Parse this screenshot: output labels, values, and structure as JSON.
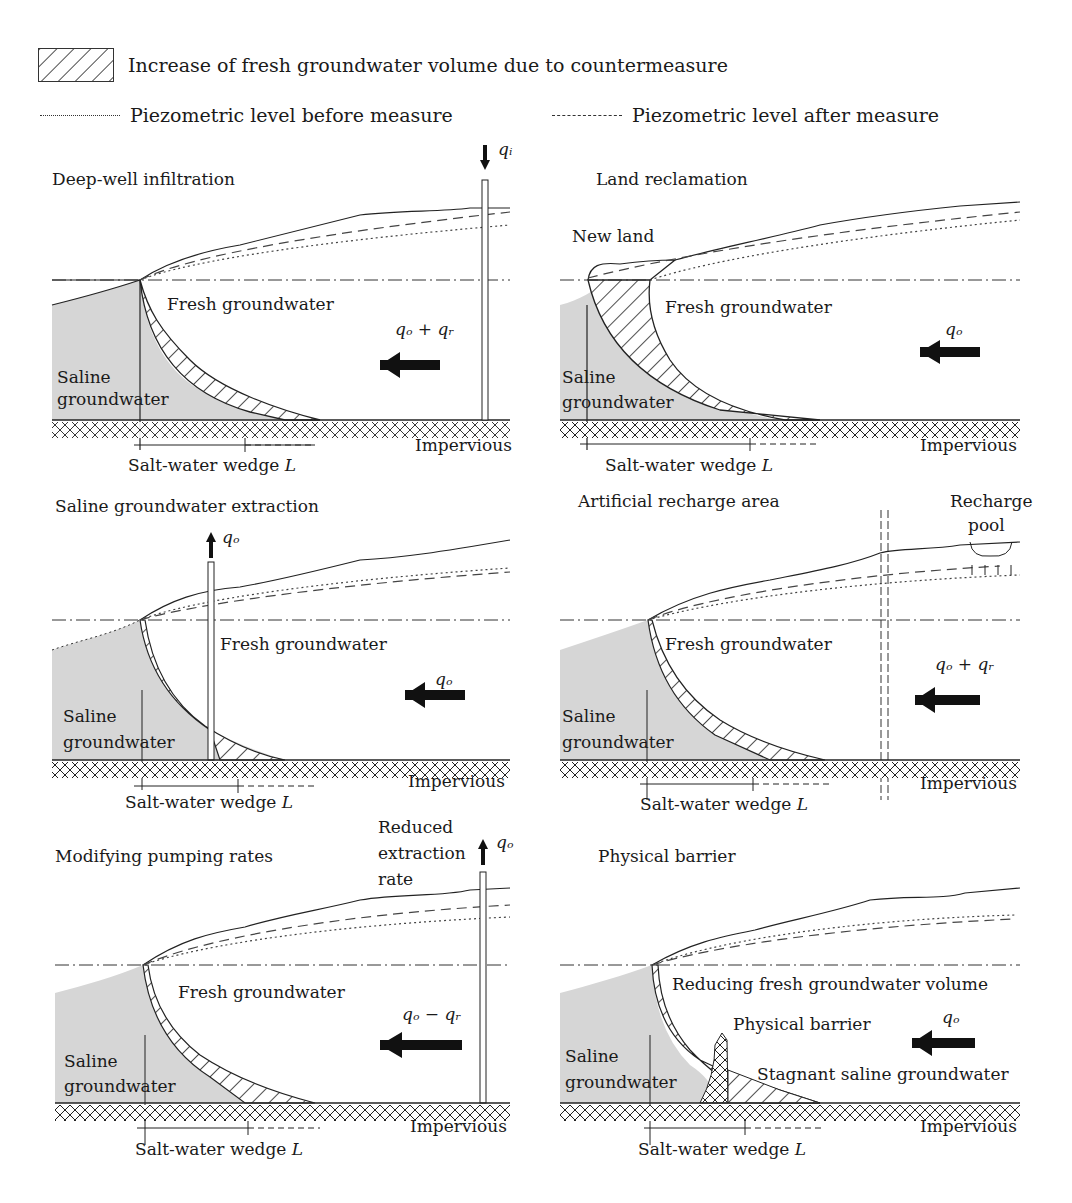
{
  "legend": {
    "hatch_label": "Increase of fresh groundwater volume due to countermeasure",
    "before_label": "Piezometric level before measure",
    "after_label": "Piezometric level after measure"
  },
  "common": {
    "fresh": "Fresh groundwater",
    "saline_1": "Saline",
    "saline_2": "groundwater",
    "impervious": "Impervious",
    "wedge": "Salt-water wedge ",
    "wedge_var": "L"
  },
  "panels": [
    {
      "id": "deep-well",
      "title": "Deep-well infiltration",
      "flow": "qₒ + qᵣ",
      "well_label": "qᵢ"
    },
    {
      "id": "land-reclamation",
      "title": "Land reclamation",
      "flow": "qₒ",
      "extra": "New land"
    },
    {
      "id": "saline-extraction",
      "title": "Saline groundwater extraction",
      "flow": "qₒ",
      "well_label": "qₒ"
    },
    {
      "id": "artificial-recharge",
      "title": "Artificial recharge area",
      "flow": "qₒ + qᵣ",
      "extra_1": "Recharge",
      "extra_2": "pool"
    },
    {
      "id": "pumping-rates",
      "title": "Modifying pumping rates",
      "flow": "qₒ − qᵣ",
      "well_label": "qₒ",
      "extra_1": "Reduced",
      "extra_2": "extraction",
      "extra_3": "rate"
    },
    {
      "id": "physical-barrier",
      "title": "Physical barrier",
      "flow": "qₒ",
      "extra_1": "Reducing fresh groundwater volume",
      "extra_2": "Physical barrier",
      "extra_3": "Stagnant saline groundwater"
    }
  ],
  "colors": {
    "saline_fill": "#d6d6d6",
    "line": "#222222",
    "background": "#ffffff"
  }
}
